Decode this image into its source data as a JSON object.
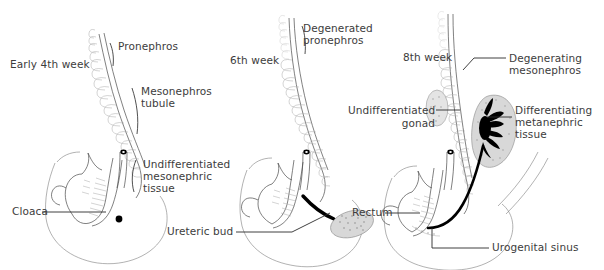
{
  "figure": {
    "background_color": "#ffffff",
    "ink_color": "#4a4a4a",
    "text_color": "#3c3c3c",
    "accent_color": "#000000"
  },
  "panels": [
    {
      "id": "panel-early-4th-week",
      "stage_label": "Early 4th week",
      "labels": [
        {
          "name": "pronephros",
          "text": "Pronephros"
        },
        {
          "name": "mesonephros-tubule",
          "text": "Mesonephros\ntubule"
        },
        {
          "name": "undifferentiated-mesonephric-tissue",
          "text": "Undifferentiated\nmesonephric\ntissue"
        },
        {
          "name": "cloaca",
          "text": "Cloaca"
        }
      ]
    },
    {
      "id": "panel-6th-week",
      "stage_label": "6th week",
      "labels": [
        {
          "name": "degenerated-pronephros",
          "text": "Degenerated\npronephros"
        },
        {
          "name": "ureteric-bud",
          "text": "Ureteric bud"
        }
      ]
    },
    {
      "id": "panel-8th-week",
      "stage_label": "8th week",
      "labels": [
        {
          "name": "degenerating-mesonephros",
          "text": "Degenerating\nmesonephros"
        },
        {
          "name": "undifferentiated-gonad",
          "text": "Undifferentiated\ngonad"
        },
        {
          "name": "differentiating-metanephric-tissue",
          "text": "Differentiating\nmetanephric\ntissue"
        },
        {
          "name": "rectum",
          "text": "Rectum"
        },
        {
          "name": "urogenital-sinus",
          "text": "Urogenital sinus"
        }
      ]
    }
  ],
  "text": {
    "p1_stage": "Early 4th week",
    "p1_pronephros": "Pronephros",
    "p1_meso_l1": "Mesonephros",
    "p1_meso_l2": "tubule",
    "p1_undiff_l1": "Undifferentiated",
    "p1_undiff_l2": "mesonephric",
    "p1_undiff_l3": "tissue",
    "p1_cloaca": "Cloaca",
    "p2_stage": "6th week",
    "p2_degen_l1": "Degenerated",
    "p2_degen_l2": "pronephros",
    "p2_ureteric": "Ureteric bud",
    "p3_stage": "8th week",
    "p3_degen_l1": "Degenerating",
    "p3_degen_l2": "mesonephros",
    "p3_gonad_l1": "Undifferentiated",
    "p3_gonad_l2": "gonad",
    "p3_meta_l1": "Differentiating",
    "p3_meta_l2": "metanephric",
    "p3_meta_l3": "tissue",
    "p3_rectum": "Rectum",
    "p3_ugsinus": "Urogenital sinus"
  }
}
